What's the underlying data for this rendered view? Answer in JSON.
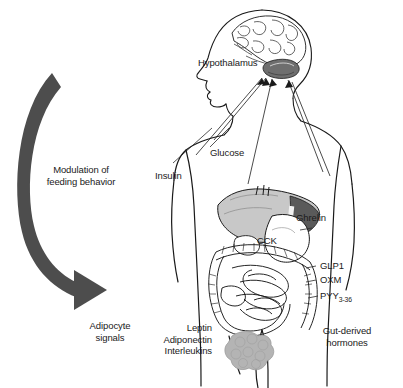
{
  "figure": {
    "background_color": "#ffffff",
    "ink_color": "#1a1a1a",
    "arrow_color": "#4d4d4d",
    "organ_shade": "#9a9a9a",
    "adipocyte_color": "#b0b0b0"
  },
  "labels": {
    "hypothalamus": "Hypothalamus",
    "glucose": "Glucose",
    "insulin": "Insulin",
    "ghrelin": "Ghrelin",
    "cck": "CCK",
    "glp1": "GLP1",
    "oxm": "OXM",
    "pyy": "PYY",
    "pyy_subscript": "3-36",
    "modulation_line1": "Modulation of",
    "modulation_line2": "feeding behavior",
    "adipocyte_line1": "Adipocyte",
    "adipocyte_line2": "signals",
    "leptin": "Leptin",
    "adiponectin": "Adiponectin",
    "interleukins": "Interleukins",
    "gut_line1": "Gut-derived",
    "gut_line2": "hormones"
  },
  "groups": {
    "adipocyte_signals": [
      "Leptin",
      "Adiponectin",
      "Interleukins"
    ],
    "gut_derived_hormones": [
      "Ghrelin",
      "CCK",
      "GLP1",
      "OXM",
      "PYY3-36"
    ],
    "central_inputs": [
      "Glucose",
      "Insulin"
    ]
  },
  "anatomy": {
    "head": "human-head-profile",
    "brain": "brain-outline",
    "hypothalamus_organ": "hypothalamus-shaded",
    "torso": "human-torso-outline",
    "liver": "liver-shaded",
    "stomach": "stomach-outline",
    "intestines": "intestine-coils",
    "adipose": "adipocyte-cluster"
  }
}
